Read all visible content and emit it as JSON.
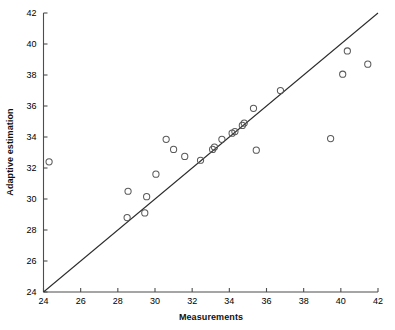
{
  "chart_data": {
    "type": "scatter",
    "title": "",
    "xlabel": "Measurements",
    "ylabel": "Adaptive estimation",
    "xlim": [
      24,
      42
    ],
    "ylim": [
      24,
      42
    ],
    "xticks": [
      24,
      26,
      28,
      30,
      32,
      34,
      36,
      38,
      40,
      42
    ],
    "yticks": [
      24,
      26,
      28,
      30,
      32,
      34,
      36,
      38,
      40,
      42
    ],
    "xticklabels": [
      "24",
      "26",
      "28",
      "30",
      "32",
      "34",
      "36",
      "38",
      "40",
      "42"
    ],
    "yticklabels": [
      "24",
      "26",
      "28",
      "30",
      "32",
      "34",
      "36",
      "38",
      "40",
      "42"
    ],
    "grid": false,
    "legend": null,
    "marker": "open-circle",
    "marker_color": "#5a5a5a",
    "line_color": "#2b2b2b",
    "reference_line": {
      "label": "identity line y = x",
      "x": [
        24,
        42
      ],
      "y": [
        24,
        42
      ]
    },
    "points": [
      {
        "x": 24.3,
        "y": 32.4
      },
      {
        "x": 28.5,
        "y": 28.8
      },
      {
        "x": 28.55,
        "y": 30.5
      },
      {
        "x": 29.45,
        "y": 29.1
      },
      {
        "x": 29.55,
        "y": 30.15
      },
      {
        "x": 30.05,
        "y": 31.6
      },
      {
        "x": 30.6,
        "y": 33.85
      },
      {
        "x": 31.0,
        "y": 33.2
      },
      {
        "x": 31.6,
        "y": 32.75
      },
      {
        "x": 32.45,
        "y": 32.5
      },
      {
        "x": 33.1,
        "y": 33.2
      },
      {
        "x": 33.2,
        "y": 33.35
      },
      {
        "x": 33.6,
        "y": 33.85
      },
      {
        "x": 34.15,
        "y": 34.25
      },
      {
        "x": 34.3,
        "y": 34.35
      },
      {
        "x": 34.7,
        "y": 34.75
      },
      {
        "x": 34.8,
        "y": 34.9
      },
      {
        "x": 35.3,
        "y": 35.85
      },
      {
        "x": 35.45,
        "y": 33.15
      },
      {
        "x": 36.75,
        "y": 37.0
      },
      {
        "x": 39.45,
        "y": 33.9
      },
      {
        "x": 40.1,
        "y": 38.05
      },
      {
        "x": 40.35,
        "y": 39.55
      },
      {
        "x": 41.45,
        "y": 38.7
      }
    ]
  }
}
